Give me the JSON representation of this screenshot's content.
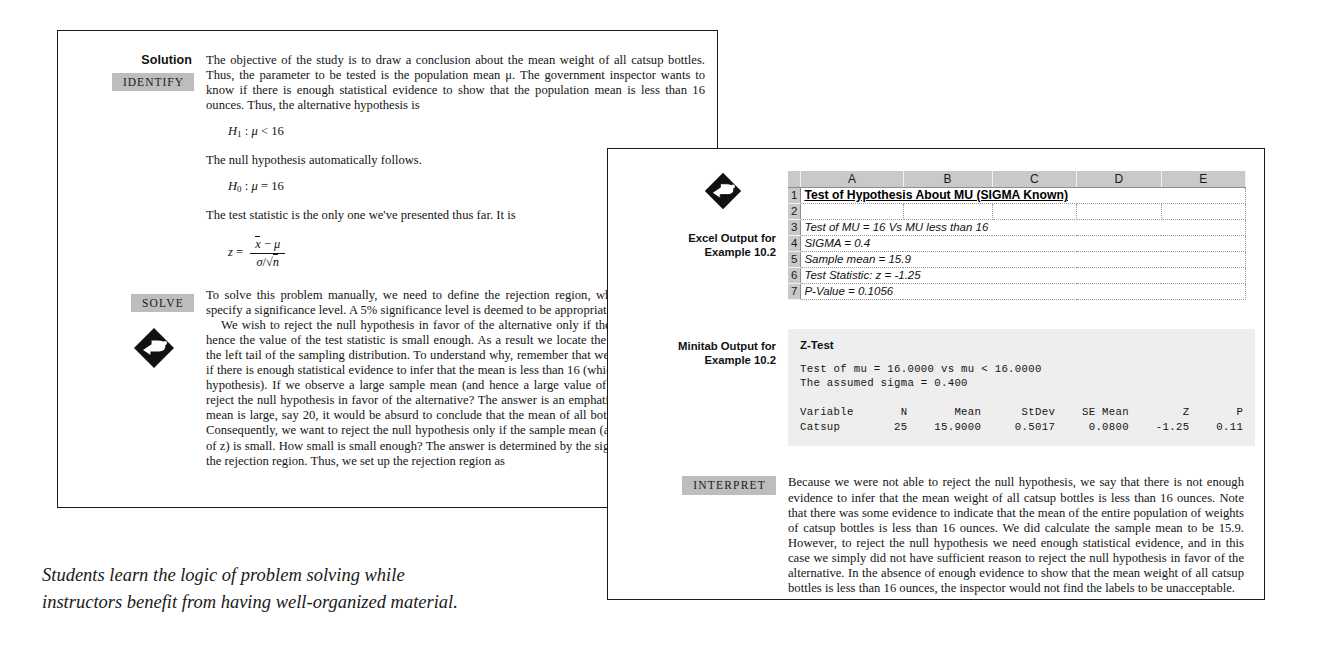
{
  "back_page": {
    "solution_label": "Solution",
    "tags": {
      "identify": "IDENTIFY",
      "solve": "SOLVE"
    },
    "icons": {
      "pointing_hand": "pointing-hand-diamond-icon"
    },
    "identify_paragraph": "The objective of the study is to draw a conclusion about the mean weight of all catsup bottles. Thus, the parameter to be tested is the population mean μ. The government inspector wants to know if there is enough statistical evidence to show that the population mean is less than 16 ounces. Thus, the alternative hypothesis is",
    "alt_hypothesis": "H₁ : μ < 16",
    "null_intro": "The null hypothesis automatically follows.",
    "null_hypothesis": "H₀ : μ = 16",
    "statistic_intro": "The test statistic is the only one we've presented thus far. It is",
    "statistic_formula": {
      "lhs": "z =",
      "numerator": "x̄ − μ",
      "denominator": "σ/√n"
    },
    "solve_paragraph_1": "To solve this problem manually, we need to define the rejection region, which requires us to specify a significance level. A 5% significance level is deemed to be appropriate.",
    "solve_paragraph_2": "We wish to reject the null hypothesis in favor of the alternative only if the sample mean and hence the value of the test statistic is small enough. As a result we locate the rejection region in the left tail of the sampling distribution. To understand why, remember that we're trying to decide if there is enough statistical evidence to infer that the mean is less than 16 (which is the alternative hypothesis). If we observe a large sample mean (and hence a large value of z), do we want to reject the null hypothesis in favor of the alternative? The answer is an emphatic no. If the sample mean is large, say 20, it would be absurd to conclude that the mean of all bottles is less than 16. Consequently, we want to reject the null hypothesis only if the sample mean (and hence the value of z) is small. How small is small enough? The answer is determined by the significance level and the rejection region. Thus, we set up the rejection region as"
  },
  "front_page": {
    "excel": {
      "label_line_1": "Excel Output for",
      "label_line_2": "Example 10.2",
      "icon": "pointing-hand-diamond-icon",
      "column_headers": [
        "A",
        "B",
        "C",
        "D",
        "E"
      ],
      "row_numbers": [
        "1",
        "2",
        "3",
        "4",
        "5",
        "6",
        "7"
      ],
      "rows": [
        {
          "n": "1",
          "text": "Test of Hypothesis About MU (SIGMA Known)",
          "style": "title"
        },
        {
          "n": "2",
          "text": "",
          "style": "cell"
        },
        {
          "n": "3",
          "text": "Test of MU = 16  Vs  MU less than 16",
          "style": "cell"
        },
        {
          "n": "4",
          "text": "SIGMA = 0.4",
          "style": "cell"
        },
        {
          "n": "5",
          "text": "Sample mean = 15.9",
          "style": "cell"
        },
        {
          "n": "6",
          "text": "Test Statistic:  z = -1.25",
          "style": "cell"
        },
        {
          "n": "7",
          "text": "P-Value = 0.1056",
          "style": "cell"
        }
      ]
    },
    "minitab": {
      "label_line_1": "Minitab Output for",
      "label_line_2": "Example 10.2",
      "title": "Z-Test",
      "body": "Test of mu = 16.0000 vs mu < 16.0000\nThe assumed sigma = 0.400\n\nVariable       N       Mean      StDev    SE Mean        Z       P\nCatsup        25    15.9000     0.5017     0.0800    -1.25    0.11"
    },
    "interpret": {
      "tag": "INTERPRET",
      "paragraph": "Because we were not able to reject the null hypothesis, we say that there is not enough evidence to infer that the mean weight of all catsup bottles is less than 16 ounces. Note that there was some evidence to indicate that the mean of the entire population of weights of catsup bottles is less than 16 ounces. We did calculate the sample mean to be 15.9. However, to reject the null hypothesis we need enough statistical evidence, and in this case we simply did not have sufficient reason to reject the null hypothesis in favor of the alternative. In the absence of enough evidence to show that the mean weight of all catsup bottles is less than 16 ounces, the inspector would not find the labels to be unacceptable."
    }
  },
  "caption": {
    "text": "Students learn the logic of problem solving while instructors benefit from having well-organized material."
  },
  "colors": {
    "tag_background": "#bdbdbd",
    "minitab_background": "#eeeeee",
    "excel_header": "#c9c9c9",
    "page_border": "#1b1b1b",
    "text": "#141414"
  }
}
